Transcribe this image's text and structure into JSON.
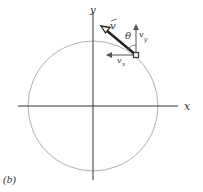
{
  "figure": {
    "caption": "(b)",
    "axes": {
      "x_label": "x",
      "y_label": "y"
    },
    "circle": {
      "description": "circular path",
      "color": "#b0b0b0"
    },
    "point": {
      "description": "particle on circle"
    },
    "vectors": {
      "velocity": {
        "label": "v",
        "has_arrow_accent": true,
        "color": "#222222"
      },
      "vx": {
        "label": "v",
        "subscript": "x"
      },
      "vy": {
        "label": "v",
        "subscript": "y"
      }
    },
    "angle": {
      "label": "θ"
    },
    "colors": {
      "axis": "#333333",
      "circle": "#b0b0b0",
      "vector": "#222222",
      "component": "#555555"
    }
  }
}
